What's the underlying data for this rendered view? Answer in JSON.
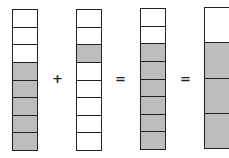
{
  "diagram": {
    "colors": {
      "shaded": "#bdbdbd",
      "border": "#222222",
      "unshaded": "#ffffff"
    },
    "bars": [
      {
        "name": "five-eighths",
        "cells": [
          0,
          0,
          0,
          1,
          1,
          1,
          1,
          1
        ]
      },
      {
        "name": "one-eighth",
        "cells": [
          0,
          0,
          1,
          0,
          0,
          0,
          0,
          0
        ]
      },
      {
        "name": "six-eighths",
        "cells": [
          0,
          0,
          1,
          1,
          1,
          1,
          1,
          1
        ]
      },
      {
        "name": "three-fourths",
        "cells": [
          0,
          1,
          1,
          1
        ]
      }
    ],
    "operators": [
      "+",
      "=",
      "="
    ]
  }
}
